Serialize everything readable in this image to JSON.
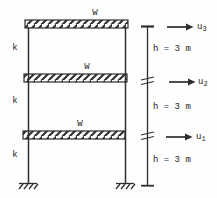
{
  "colors": {
    "ink": "#2e2e2e",
    "paper": "#fefefe"
  },
  "floors": {
    "mass_labels": [
      "W",
      "W",
      "W"
    ],
    "stiffness_labels": [
      "k",
      "k",
      "k"
    ],
    "height_labels": [
      "h = 3 m",
      "h = 3 m",
      "h = 3 m"
    ]
  },
  "displacements": [
    {
      "base": "u",
      "sub": "3"
    },
    {
      "base": "u",
      "sub": "2"
    },
    {
      "base": "u",
      "sub": "1"
    }
  ]
}
